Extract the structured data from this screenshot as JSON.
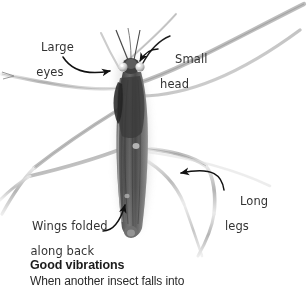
{
  "figure": {
    "kind": "photograph",
    "background_color": "#ffffff",
    "body_color": "#4a4a4a",
    "leg_color": "#c9c9c9",
    "shadow_color": "#d8d8d8"
  },
  "annotations": {
    "leader_color": "#1a1a1a",
    "items": [
      {
        "name": "large-eyes",
        "line1": "Large",
        "line2": "eyes"
      },
      {
        "name": "small-head",
        "line1": "Small",
        "line2": "head"
      },
      {
        "name": "long-legs",
        "line1": "Long",
        "line2": "legs"
      },
      {
        "name": "wings-folded",
        "line1": "Wings folded",
        "line2": "along back"
      }
    ]
  },
  "caption": {
    "heading": "Good vibrations",
    "body": "When another insect falls into"
  }
}
